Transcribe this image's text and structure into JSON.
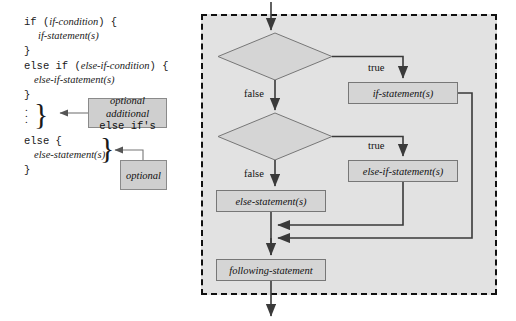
{
  "code_panel": {
    "lines": [
      {
        "id": "l1",
        "text": "if (",
        "em": "if-condition",
        "tail": ") {"
      },
      {
        "id": "l2",
        "text": "",
        "em": "if-statement(s)",
        "tail": ""
      },
      {
        "id": "l3",
        "text": "}",
        "em": "",
        "tail": ""
      },
      {
        "id": "l4",
        "text": "else if (",
        "em": "else-if-condition",
        "tail": ") {"
      },
      {
        "id": "l5",
        "text": "",
        "em": "else-if-statement(s)",
        "tail": ""
      },
      {
        "id": "l6",
        "text": "}",
        "em": "",
        "tail": ""
      },
      {
        "id": "l7",
        "text": "else {",
        "em": "",
        "tail": ""
      },
      {
        "id": "l8",
        "text": "",
        "em": "else-statement(s)",
        "tail": ""
      },
      {
        "id": "l9",
        "text": "}",
        "em": "",
        "tail": ""
      }
    ],
    "vertical_dots": "·\n·\n·",
    "callout_optional_additional": {
      "line1": "optional additional",
      "line2": "else if's"
    },
    "callout_optional": {
      "line1": "optional"
    }
  },
  "flowchart": {
    "nodes": {
      "if_condition": "if-condition",
      "if_statements": "if-statement(s)",
      "else_if_condition": "else-if-condition",
      "else_if_statements": "else-if-statement(s)",
      "else_statements": "else-statement(s)",
      "following_statement": "following-statement"
    },
    "edge_labels": {
      "if_true": "true",
      "if_false": "false",
      "elseif_true": "true",
      "elseif_false": "false"
    }
  },
  "colors": {
    "node_fill": "#d5d5d5",
    "node_stroke": "#777777",
    "panel_fill": "#e2e2e2",
    "callout_fill": "#cfcfcf",
    "callout_stroke": "#8a8a8a",
    "line": "#3a3a3a",
    "dash_border": "#111111"
  }
}
